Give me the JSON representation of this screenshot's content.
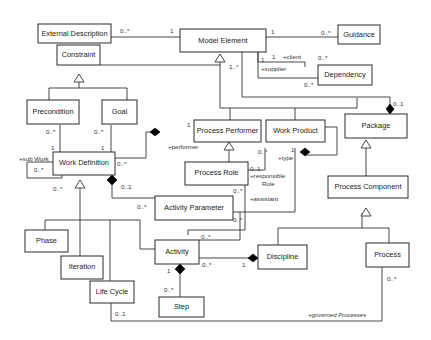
{
  "diagram": {
    "type": "uml-class-diagram",
    "classes": {
      "external_description": "External Description",
      "model_element": "Model Element",
      "guidance": "Guidance",
      "constraint": "Constraint",
      "dependency": "Dependency",
      "precondition": "Precondition",
      "goal": "Goal",
      "process_performer": "Process Performer",
      "work_product": "Work Product",
      "package": "Package",
      "work_definition": "Work Definition",
      "process_role": "Process Role",
      "process_component": "Process Component",
      "activity_parameter": "Activity Parameter",
      "phase": "Phase",
      "iteration": "Iteration",
      "activity": "Activity",
      "discipline": "Discipline",
      "process": "Process",
      "life_cycle": "Life Cycle",
      "step": "Step"
    },
    "labels": {
      "extdesc_mult": "0..*",
      "model_extdesc_mult": "1",
      "model_guid_mult": "1",
      "guid_mult": "0..*",
      "dep_client_mult": "1",
      "dep_client_role": "+client",
      "dep_client_dep_mult": "0..*",
      "dep_supplier_mult": "1",
      "dep_supplier_role": "+supplier",
      "dep_supplier_dep_mult": "0..*",
      "model_pkg_mult": "1..*",
      "pkg_mult": "0..1",
      "pre_mult": "0..*",
      "pre_wd_mult": "1",
      "goal_mult": "0..*",
      "goal_wd_mult": "1",
      "subwork_role": "+sub Work",
      "subwork_mult1": "0..*",
      "subwork_mult2": "0..*",
      "performer_mult": "1",
      "performer_role": "+performer",
      "wd_performer_mult": "0..*",
      "wd_param_comp_mult": "0..1",
      "param_mult": "0..*",
      "wp_type_mult": "1",
      "wp_type_role": "+type",
      "pr_resp_mult1": "0..*",
      "pr_resp_mult2": "0..1",
      "responsible_role_1": "+responsible",
      "responsible_role_2": "Role",
      "assistant_mult": "0..*",
      "assistant_role": "+assistant",
      "param_type_mult": "0..*",
      "act_assist_mult": "0..*",
      "act_disc_mult": "0..*",
      "disc_mult": "1",
      "act_step_mult": "1",
      "step_mult": "0..*",
      "lifecycle_mult": "0..1",
      "process_mult": "0..*",
      "governed_role": "+governed Processes"
    }
  }
}
